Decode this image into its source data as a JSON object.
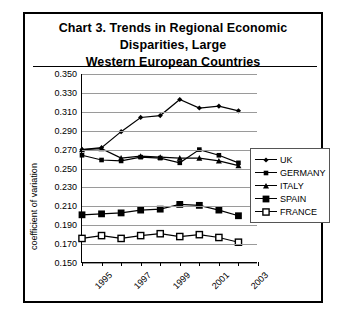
{
  "title": "Chart 3.  Trends in Regional Economic Disparities, Large Western European Countries",
  "title_line1": "Chart 3.  Trends in Regional Economic Disparities, Large",
  "title_line2": "Western European Countries",
  "legend": {
    "items": [
      {
        "label": "UK",
        "marker": "small-diamond"
      },
      {
        "label": "GERMANY",
        "marker": "small-square"
      },
      {
        "label": "ITALY",
        "marker": "triangle"
      },
      {
        "label": "SPAIN",
        "marker": "large-square"
      },
      {
        "label": "FRANCE",
        "marker": "open-square"
      }
    ]
  },
  "chart_data": {
    "type": "line",
    "title": "Chart 3.  Trends in Regional Economic Disparities, Large Western European Countries",
    "xlabel": "",
    "ylabel": "coefficient of variation",
    "x": [
      1995,
      1996,
      1997,
      1998,
      1999,
      2000,
      2001,
      2002,
      2003,
      2004
    ],
    "xtick_labels": [
      "1995",
      "1997",
      "1999",
      "2001",
      "2003"
    ],
    "xtick_values": [
      1995,
      1997,
      1999,
      2001,
      2003
    ],
    "xlim": [
      1995,
      2004
    ],
    "ylim": [
      0.15,
      0.35
    ],
    "ytick_labels": [
      "0.350",
      "0.330",
      "0.310",
      "0.290",
      "0.270",
      "0.250",
      "0.230",
      "0.210",
      "0.190",
      "0.170",
      "0.150"
    ],
    "ytick_values": [
      0.35,
      0.33,
      0.31,
      0.29,
      0.27,
      0.25,
      0.23,
      0.21,
      0.19,
      0.17,
      0.15
    ],
    "grid": true,
    "legend_position": "right",
    "series": [
      {
        "name": "UK",
        "marker": "small-diamond",
        "values": [
          0.27,
          0.272,
          0.289,
          0.304,
          0.306,
          0.323,
          0.314,
          0.316,
          0.311,
          null
        ]
      },
      {
        "name": "GERMANY",
        "marker": "small-square",
        "values": [
          0.264,
          0.259,
          0.258,
          0.262,
          0.261,
          0.256,
          0.27,
          0.264,
          0.256,
          null
        ]
      },
      {
        "name": "ITALY",
        "marker": "triangle",
        "values": [
          0.27,
          0.271,
          0.261,
          0.263,
          0.262,
          0.261,
          0.261,
          0.258,
          0.253,
          null
        ]
      },
      {
        "name": "SPAIN",
        "marker": "large-square",
        "values": [
          0.201,
          0.202,
          0.203,
          0.206,
          0.207,
          0.212,
          0.211,
          0.206,
          0.2,
          null
        ]
      },
      {
        "name": "FRANCE",
        "marker": "open-square",
        "values": [
          0.176,
          0.179,
          0.176,
          0.179,
          0.181,
          0.178,
          0.18,
          0.177,
          0.172,
          null
        ]
      }
    ]
  }
}
